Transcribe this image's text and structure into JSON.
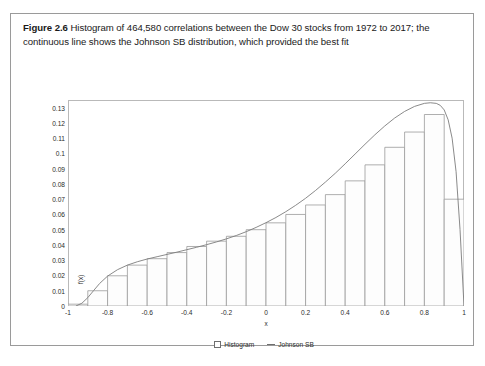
{
  "figure": {
    "label": "Figure 2.6",
    "caption": "Histogram of 464,580 correlations between the Dow 30 stocks from 1972 to 2017; the continuous line shows the Johnson SB distribution, which provided the best fit"
  },
  "legend": {
    "histogram_label": "Histogram",
    "curve_label": "Johnson SB"
  },
  "colors": {
    "bar_stroke": "#9a9a9a",
    "bar_fill": "#fdfdfd",
    "curve": "#7d7d7d",
    "frame": "#b9b9b9",
    "text": "#2b2b2b"
  },
  "chart_data": {
    "type": "bar",
    "title": "",
    "xlabel": "x",
    "ylabel": "f(x)",
    "xlim": [
      -1.0,
      1.0
    ],
    "ylim": [
      0,
      0.135
    ],
    "grid": false,
    "legend_position": "bottom-center",
    "x_ticks": [
      -1,
      -0.8,
      -0.6,
      -0.4,
      -0.2,
      0,
      0.2,
      0.4,
      0.6,
      0.8,
      1
    ],
    "x_tick_labels": [
      "-1",
      "-0.8",
      "-0.6",
      "-0.4",
      "-0.2",
      "0",
      "0.2",
      "0.4",
      "0.6",
      "0.8",
      "1"
    ],
    "y_ticks": [
      0,
      0.01,
      0.02,
      0.03,
      0.04,
      0.05,
      0.06,
      0.07,
      0.08,
      0.09,
      0.1,
      0.11,
      0.12,
      0.13
    ],
    "y_tick_labels": [
      "0",
      "0.01",
      "0.02",
      "0.03",
      "0.04",
      "0.05",
      "0.06",
      "0.07",
      "0.08",
      "0.09",
      "0.1",
      "0.11",
      "0.12",
      "0.13"
    ],
    "bin_edges": [
      -1.0,
      -0.9,
      -0.8,
      -0.7,
      -0.6,
      -0.5,
      -0.4,
      -0.3,
      -0.2,
      -0.1,
      0.0,
      0.1,
      0.2,
      0.3,
      0.4,
      0.5,
      0.6,
      0.7,
      0.8,
      0.9,
      1.0
    ],
    "categories": [
      "-1.0 to -0.9",
      "-0.9 to -0.8",
      "-0.8 to -0.7",
      "-0.7 to -0.6",
      "-0.6 to -0.5",
      "-0.5 to -0.4",
      "-0.4 to -0.3",
      "-0.3 to -0.2",
      "-0.2 to -0.1",
      "-0.1 to 0.0",
      "0.0 to 0.1",
      "0.1 to 0.2",
      "0.2 to 0.3",
      "0.3 to 0.4",
      "0.4 to 0.5",
      "0.5 to 0.6",
      "0.6 to 0.7",
      "0.7 to 0.8",
      "0.8 to 0.9",
      "0.9 to 1.0"
    ],
    "values": [
      0.0012,
      0.01,
      0.0198,
      0.0268,
      0.031,
      0.035,
      0.039,
      0.0425,
      0.0457,
      0.05,
      0.0545,
      0.06,
      0.0662,
      0.073,
      0.082,
      0.0925,
      0.104,
      0.114,
      0.1255,
      0.07
    ],
    "series": [
      {
        "name": "Histogram",
        "type": "bar",
        "values": [
          0.0012,
          0.01,
          0.0198,
          0.0268,
          0.031,
          0.035,
          0.039,
          0.0425,
          0.0457,
          0.05,
          0.0545,
          0.06,
          0.0662,
          0.073,
          0.082,
          0.0925,
          0.104,
          0.114,
          0.1255,
          0.07
        ]
      },
      {
        "name": "Johnson SB",
        "type": "line",
        "x": [
          -0.96,
          -0.93,
          -0.9,
          -0.87,
          -0.84,
          -0.8,
          -0.75,
          -0.7,
          -0.65,
          -0.6,
          -0.55,
          -0.5,
          -0.45,
          -0.4,
          -0.35,
          -0.3,
          -0.25,
          -0.2,
          -0.15,
          -0.1,
          -0.05,
          0.0,
          0.05,
          0.1,
          0.15,
          0.2,
          0.25,
          0.3,
          0.35,
          0.4,
          0.45,
          0.5,
          0.55,
          0.6,
          0.65,
          0.7,
          0.75,
          0.8,
          0.83,
          0.86,
          0.88,
          0.9,
          0.92,
          0.94,
          0.96,
          0.98,
          1.0
        ],
        "y": [
          0.0,
          0.0018,
          0.0055,
          0.0102,
          0.0148,
          0.0196,
          0.0238,
          0.0268,
          0.029,
          0.0308,
          0.0323,
          0.0338,
          0.0353,
          0.0369,
          0.0385,
          0.0402,
          0.042,
          0.044,
          0.0462,
          0.0487,
          0.0515,
          0.0546,
          0.058,
          0.0618,
          0.066,
          0.0706,
          0.0757,
          0.0812,
          0.087,
          0.0932,
          0.0996,
          0.106,
          0.1122,
          0.118,
          0.1232,
          0.1275,
          0.1308,
          0.1328,
          0.1332,
          0.1328,
          0.1315,
          0.1285,
          0.122,
          0.11,
          0.088,
          0.05,
          0.0
        ]
      }
    ]
  }
}
